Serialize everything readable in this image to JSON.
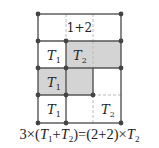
{
  "diagram": {
    "type": "grid-area-decomposition",
    "colors": {
      "line": "#555555",
      "dot": "#444444",
      "shade": "#d4d4d4",
      "dashed": "#bbbbbb"
    },
    "top_label": "1+2",
    "cells": [
      {
        "label": "T",
        "sub": "1",
        "shaded": false,
        "pos": "row2-col1"
      },
      {
        "label": "T",
        "sub": "2",
        "shaded": true,
        "pos": "row2-col2"
      },
      {
        "label": "T",
        "sub": "1",
        "shaded": true,
        "pos": "row3-col1"
      },
      {
        "label": "T",
        "sub": "1",
        "shaded": false,
        "pos": "row4-col1"
      },
      {
        "label": "T",
        "sub": "2",
        "shaded": false,
        "pos": "row4-col3"
      }
    ]
  },
  "equation": {
    "lhs_coef": "3",
    "times": "×",
    "open": "(",
    "t1": "T",
    "t1_sub": "1",
    "plus": "+",
    "t2": "T",
    "t2_sub": "2",
    "close": ")",
    "equals": "=",
    "rhs_paren": "(2+2)",
    "rhs_times": "×",
    "rhs_t": "T",
    "rhs_t_sub": "2"
  }
}
